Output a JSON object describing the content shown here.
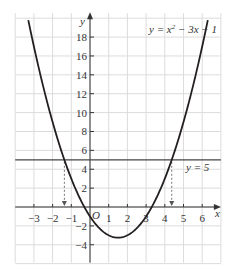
{
  "chart_data": {
    "type": "line",
    "title": "",
    "xlabel": "x",
    "ylabel": "y",
    "origin_label": "O",
    "xlim": [
      -4,
      7
    ],
    "ylim": [
      -6,
      20
    ],
    "grid": true,
    "x_ticks": [
      -3,
      -2,
      -1,
      1,
      2,
      3,
      4,
      5,
      6
    ],
    "y_ticks": [
      -4,
      -2,
      2,
      4,
      6,
      8,
      10,
      12,
      14,
      16,
      18
    ],
    "series": [
      {
        "name": "y = x² − 3x − 1",
        "type": "curve",
        "expression": "x^2 - 3x - 1",
        "x_range": [
          -3.3,
          6.3
        ]
      },
      {
        "name": "y = 5",
        "type": "horizontal_line",
        "y": 5
      }
    ],
    "annotations": [
      {
        "text": "y = x² − 3x − 1",
        "position": "top-right"
      },
      {
        "text": "y = 5",
        "position": "right, below line"
      },
      {
        "type": "dashed_arrow",
        "x": -1.37,
        "from_y": 5,
        "to_y": 0
      },
      {
        "type": "dashed_arrow",
        "x": 4.37,
        "from_y": 5,
        "to_y": 0
      }
    ],
    "intersections": [
      -1.37,
      4.37
    ]
  },
  "labels": {
    "curve_eq_y": "y",
    "curve_eq_rest": " = x",
    "curve_eq_sup": "2",
    "curve_eq_tail": " − 3x − 1",
    "line_eq": "y = 5",
    "x_axis": "x",
    "y_axis": "y",
    "origin": "O"
  },
  "colors": {
    "grid": "#dcdcdc",
    "axis": "#333333",
    "curve": "#231f20",
    "line": "#444444"
  }
}
